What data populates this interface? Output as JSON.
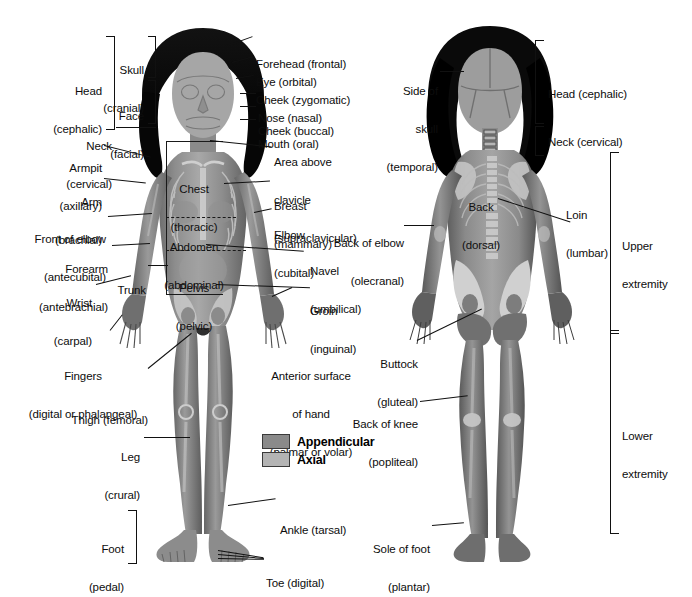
{
  "background": "#ffffff",
  "legend": {
    "items": [
      {
        "label": "Appendicular",
        "color": "#8a8a8a"
      },
      {
        "label": "Axial",
        "color": "#b4b4b4"
      }
    ]
  },
  "anterior": {
    "view_name": "anterior-view",
    "on_body_labels": [
      {
        "name": "chest",
        "line1": "Chest",
        "line2": "(thoracic)"
      },
      {
        "name": "abdomen",
        "line1": "Abdomen",
        "line2": "(abdominal)"
      },
      {
        "name": "pelvis",
        "line1": "Pelvis",
        "line2": "(pelvic)"
      }
    ],
    "left_labels": [
      {
        "name": "head",
        "line1": "Head",
        "line2": "(cephalic)"
      },
      {
        "name": "skull",
        "line1": "Skull",
        "line2": "(cranial)"
      },
      {
        "name": "face",
        "line1": "Face",
        "line2": "(facial)"
      },
      {
        "name": "neck",
        "line1": "Neck",
        "line2": "(cervical)"
      },
      {
        "name": "armpit",
        "line1": "Armpit",
        "line2": "(axillary)"
      },
      {
        "name": "arm",
        "line1": "Arm",
        "line2": "(brachial)"
      },
      {
        "name": "front-of-elbow",
        "line1": "Front of elbow",
        "line2": "(antecubital)"
      },
      {
        "name": "forearm",
        "line1": "Forearm",
        "line2": "(antebrachial)"
      },
      {
        "name": "wrist",
        "line1": "Wrist",
        "line2": "(carpal)"
      },
      {
        "name": "trunk",
        "line1": "Trunk",
        "line2": ""
      },
      {
        "name": "fingers",
        "line1": "Fingers",
        "line2": "(digital or phalangeal)"
      },
      {
        "name": "thigh",
        "line1": "Thigh (femoral)",
        "line2": ""
      },
      {
        "name": "leg",
        "line1": "Leg",
        "line2": "(crural)"
      },
      {
        "name": "foot",
        "line1": "Foot",
        "line2": "(pedal)"
      }
    ],
    "right_labels": [
      {
        "name": "forehead",
        "line1": "Forehead (frontal)",
        "line2": ""
      },
      {
        "name": "eye",
        "line1": "Eye (orbital)",
        "line2": ""
      },
      {
        "name": "cheek-zygomatic",
        "line1": "Cheek (zygomatic)",
        "line2": ""
      },
      {
        "name": "nose",
        "line1": "Nose (nasal)",
        "line2": ""
      },
      {
        "name": "cheek-buccal",
        "line1": "Cheek (buccal)",
        "line2": ""
      },
      {
        "name": "mouth",
        "line1": "Mouth (oral)",
        "line2": ""
      },
      {
        "name": "area-above-clavicle",
        "line1": "Area above",
        "line2": "clavicle",
        "line3": "(supraclavicular)"
      },
      {
        "name": "breast",
        "line1": "Breast",
        "line2": "(mammary)"
      },
      {
        "name": "elbow",
        "line1": "Elbow",
        "line2": "(cubital)"
      },
      {
        "name": "navel",
        "line1": "Navel",
        "line2": "(umbilical)"
      },
      {
        "name": "groin",
        "line1": "Groin",
        "line2": "(inguinal)"
      },
      {
        "name": "anterior-surface-of-hand",
        "line1": "Anterior surface",
        "line2": "of hand",
        "line3": "(palmar or volar)"
      },
      {
        "name": "ankle",
        "line1": "Ankle (tarsal)",
        "line2": ""
      },
      {
        "name": "toe",
        "line1": "Toe (digital)",
        "line2": ""
      }
    ]
  },
  "posterior": {
    "view_name": "posterior-view",
    "on_body_labels": [
      {
        "name": "back",
        "line1": "Back",
        "line2": "(dorsal)"
      }
    ],
    "left_labels": [
      {
        "name": "side-of-skull",
        "line1": "Side of",
        "line2": "skull",
        "line3": "(temporal)"
      },
      {
        "name": "back-of-elbow",
        "line1": "Back of elbow",
        "line2": "(olecranal)"
      },
      {
        "name": "buttock",
        "line1": "Buttock",
        "line2": "(gluteal)"
      },
      {
        "name": "back-of-knee",
        "line1": "Back of knee",
        "line2": "(popliteal)"
      },
      {
        "name": "sole-of-foot",
        "line1": "Sole of foot",
        "line2": "(plantar)"
      }
    ],
    "right_labels": [
      {
        "name": "head",
        "line1": "Head (cephalic)",
        "line2": ""
      },
      {
        "name": "neck",
        "line1": "Neck (cervical)",
        "line2": ""
      },
      {
        "name": "loin",
        "line1": "Loin",
        "line2": "(lumbar)"
      },
      {
        "name": "upper-extremity",
        "line1": "Upper",
        "line2": "extremity"
      },
      {
        "name": "lower-extremity",
        "line1": "Lower",
        "line2": "extremity"
      }
    ]
  }
}
